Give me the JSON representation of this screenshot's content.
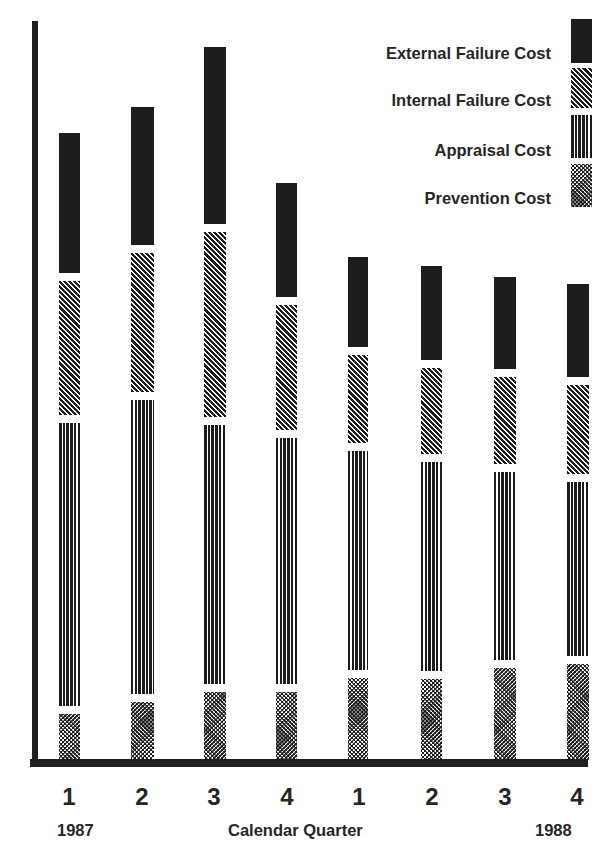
{
  "chart_data": {
    "type": "bar",
    "stacked": true,
    "title": "",
    "xlabel": "Calendar Quarter",
    "ylabel": "",
    "categories": [
      "1",
      "2",
      "3",
      "4",
      "1",
      "2",
      "3",
      "4"
    ],
    "year_labels": {
      "start": "1987",
      "end": "1988"
    },
    "units_note": "relative heights (no y-axis scale shown)",
    "series": [
      {
        "name": "Prevention Cost",
        "pattern": "crosshatch",
        "values": [
          46,
          58,
          68,
          68,
          82,
          81,
          92,
          96
        ]
      },
      {
        "name": "Appraisal Cost",
        "pattern": "vertical-lines",
        "values": [
          283,
          294,
          259,
          246,
          219,
          209,
          188,
          174
        ]
      },
      {
        "name": "Internal Failure Cost",
        "pattern": "diagonal-lines",
        "values": [
          134,
          139,
          185,
          125,
          88,
          86,
          87,
          89
        ]
      },
      {
        "name": "External Failure Cost",
        "pattern": "solid-black",
        "values": [
          140,
          138,
          177,
          114,
          90,
          94,
          92,
          93
        ]
      }
    ],
    "grid": false,
    "legend_position": "top-right",
    "colors": {
      "ink": "#1c1c1c",
      "background": "#ffffff"
    }
  },
  "legend": [
    {
      "label": "External Failure Cost"
    },
    {
      "label": "Internal Failure Cost"
    },
    {
      "label": "Appraisal Cost"
    },
    {
      "label": "Prevention Cost"
    }
  ],
  "axis": {
    "ticks": [
      "1",
      "2",
      "3",
      "4",
      "1",
      "2",
      "3",
      "4"
    ],
    "year_start": "1987",
    "year_end": "1988",
    "xlabel": "Calendar Quarter"
  }
}
